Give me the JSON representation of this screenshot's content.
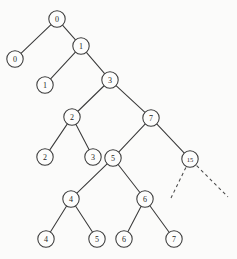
{
  "figure": {
    "background_color": "#fbfbfa",
    "stroke_color": "#3a3a3a",
    "label_color": "#262626"
  },
  "nodes": [
    {
      "id": "n0",
      "label": "0",
      "cx": 57,
      "cy": 19,
      "r": 8.2,
      "kind": "internal"
    },
    {
      "id": "l0",
      "label": "0",
      "cx": 15,
      "cy": 59,
      "r": 8.2,
      "kind": "leaf"
    },
    {
      "id": "n1",
      "label": "1",
      "cx": 81,
      "cy": 46,
      "r": 8.2,
      "kind": "internal"
    },
    {
      "id": "l1",
      "label": "1",
      "cx": 45,
      "cy": 85,
      "r": 8.2,
      "kind": "leaf"
    },
    {
      "id": "n3",
      "label": "3",
      "cx": 110,
      "cy": 80,
      "r": 8.2,
      "kind": "internal"
    },
    {
      "id": "n2",
      "label": "2",
      "cx": 72,
      "cy": 117,
      "r": 8.2,
      "kind": "internal"
    },
    {
      "id": "n7",
      "label": "7",
      "cx": 151,
      "cy": 118,
      "r": 8.2,
      "kind": "internal"
    },
    {
      "id": "l2",
      "label": "2",
      "cx": 45,
      "cy": 157,
      "r": 8.2,
      "kind": "leaf"
    },
    {
      "id": "l3",
      "label": "3",
      "cx": 93,
      "cy": 157,
      "r": 8.2,
      "kind": "leaf"
    },
    {
      "id": "n5",
      "label": "5",
      "cx": 113,
      "cy": 158,
      "r": 8.2,
      "kind": "internal"
    },
    {
      "id": "n15",
      "label": "15",
      "cx": 190,
      "cy": 159,
      "r": 8.2,
      "kind": "internal"
    },
    {
      "id": "n4",
      "label": "4",
      "cx": 71,
      "cy": 199,
      "r": 8.2,
      "kind": "internal"
    },
    {
      "id": "n6",
      "label": "6",
      "cx": 145,
      "cy": 199,
      "r": 8.2,
      "kind": "internal"
    },
    {
      "id": "l4",
      "label": "4",
      "cx": 46,
      "cy": 239,
      "r": 8.2,
      "kind": "leaf"
    },
    {
      "id": "l5",
      "label": "5",
      "cx": 97,
      "cy": 239,
      "r": 8.2,
      "kind": "leaf"
    },
    {
      "id": "l6",
      "label": "6",
      "cx": 124,
      "cy": 239,
      "r": 8.2,
      "kind": "leaf"
    },
    {
      "id": "l7",
      "label": "7",
      "cx": 174,
      "cy": 239,
      "r": 8.2,
      "kind": "leaf"
    }
  ],
  "edges": [
    {
      "from": "n0",
      "to": "l0",
      "style": "solid"
    },
    {
      "from": "n0",
      "to": "n1",
      "style": "solid"
    },
    {
      "from": "n1",
      "to": "l1",
      "style": "solid"
    },
    {
      "from": "n1",
      "to": "n3",
      "style": "solid"
    },
    {
      "from": "n3",
      "to": "n2",
      "style": "solid"
    },
    {
      "from": "n3",
      "to": "n7",
      "style": "solid"
    },
    {
      "from": "n2",
      "to": "l2",
      "style": "solid"
    },
    {
      "from": "n2",
      "to": "l3",
      "style": "solid"
    },
    {
      "from": "n7",
      "to": "n5",
      "style": "solid"
    },
    {
      "from": "n7",
      "to": "n15",
      "style": "solid"
    },
    {
      "from": "n5",
      "to": "n4",
      "style": "solid"
    },
    {
      "from": "n5",
      "to": "n6",
      "style": "solid"
    },
    {
      "from": "n4",
      "to": "l4",
      "style": "solid"
    },
    {
      "from": "n4",
      "to": "l5",
      "style": "solid"
    },
    {
      "from": "n6",
      "to": "l6",
      "style": "solid"
    },
    {
      "from": "n6",
      "to": "l7",
      "style": "solid"
    }
  ],
  "dashed_edges": [
    {
      "id": "d-left",
      "from": "n15",
      "x2": 171,
      "y2": 198
    },
    {
      "id": "d-right",
      "from": "n15",
      "x2": 228,
      "y2": 197
    }
  ]
}
